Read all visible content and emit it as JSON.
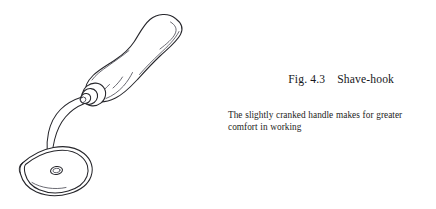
{
  "figure": {
    "label": "Fig. 4.3",
    "name": "Shave-hook",
    "caption": "The slightly cranked handle makes for greater comfort in working",
    "illustration_alt": "shave-hook-line-drawing",
    "parts": [
      {
        "name": "handle",
        "description": "bulbous waisted wooden handle"
      },
      {
        "name": "ferrule",
        "description": "collar rings where shank enters handle"
      },
      {
        "name": "shank",
        "description": "cranked curved neck"
      },
      {
        "name": "blade-head",
        "description": "teardrop shave-hook blade"
      },
      {
        "name": "blade-hole",
        "description": "small oval hole in blade"
      }
    ]
  },
  "colors": {
    "background": "#ffffff",
    "ink": "#26262b",
    "ink_soft": "#50505a",
    "text": "#17171b"
  }
}
